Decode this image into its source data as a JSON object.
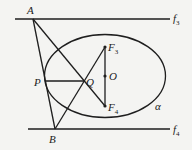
{
  "diagram": {
    "labels": {
      "A": "A",
      "B": "B",
      "P": "P",
      "Q": "Q",
      "O": "O",
      "F3": "F",
      "F3_sub": "3",
      "F4": "F",
      "F4_sub": "4",
      "f3": "f",
      "f3_sub": "3",
      "f4": "f",
      "f4_sub": "4",
      "alpha": "α"
    },
    "points": {
      "A": [
        33,
        19
      ],
      "B": [
        55,
        129
      ],
      "P": [
        45,
        81
      ],
      "Q": [
        84,
        81
      ],
      "O": [
        105,
        76
      ],
      "F3": [
        105,
        47
      ],
      "F4": [
        105,
        106
      ]
    },
    "ellipse": {
      "cx": 105,
      "cy": 76,
      "rx": 60.5,
      "ry": 41.5
    },
    "colors": {
      "line": "#1e1e1e",
      "background": "#f4f4f2"
    }
  }
}
